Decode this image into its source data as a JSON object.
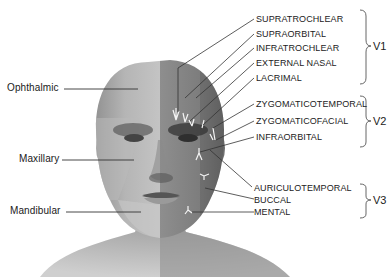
{
  "figure": {
    "colors": {
      "background": "#ffffff",
      "skin_light": "#b8b8b8",
      "skin_dark": "#7a7a7a",
      "line": "#333333",
      "nerve": "#f2f2f2"
    }
  },
  "divisions": [
    {
      "label": "Ophthalmic"
    },
    {
      "label": "Maxillary"
    },
    {
      "label": "Mandibular"
    }
  ],
  "branches": [
    {
      "label": "SUPRATROCHLEAR",
      "group": "V1"
    },
    {
      "label": "SUPRAORBITAL",
      "group": "V1"
    },
    {
      "label": "INFRATROCHLEAR",
      "group": "V1"
    },
    {
      "label": "EXTERNAL NASAL",
      "group": "V1"
    },
    {
      "label": "LACRIMAL",
      "group": "V1"
    },
    {
      "label": "ZYGOMATICOTEMPORAL",
      "group": "V2"
    },
    {
      "label": "ZYGOMATICOFACIAL",
      "group": "V2"
    },
    {
      "label": "INFRAORBITAL",
      "group": "V2"
    },
    {
      "label": "AURICULOTEMPORAL",
      "group": "V3"
    },
    {
      "label": "BUCCAL",
      "group": "V3"
    },
    {
      "label": "MENTAL",
      "group": "V3"
    }
  ],
  "groups": [
    {
      "label": "V1"
    },
    {
      "label": "V2"
    },
    {
      "label": "V3"
    }
  ]
}
